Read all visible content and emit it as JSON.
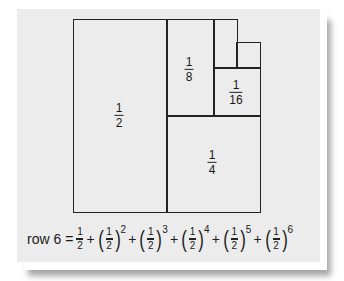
{
  "diagram": {
    "regions": [
      {
        "id": "half",
        "label_num": "1",
        "label_den": "2"
      },
      {
        "id": "quarter",
        "label_num": "1",
        "label_den": "4"
      },
      {
        "id": "eighth",
        "label_num": "1",
        "label_den": "8"
      },
      {
        "id": "sixteenth",
        "label_num": "1",
        "label_den": "16"
      },
      {
        "id": "thirty-second",
        "label_num": "",
        "label_den": ""
      },
      {
        "id": "sixty-fourth",
        "label_num": "",
        "label_den": ""
      }
    ],
    "colors": {
      "paper": "#ececec",
      "lines": "#222222"
    }
  },
  "formula": {
    "lhs": "row 6",
    "equals": "=",
    "plus": "+",
    "base_num": "1",
    "base_den": "2",
    "exponents": [
      "2",
      "3",
      "4",
      "5",
      "6"
    ]
  }
}
